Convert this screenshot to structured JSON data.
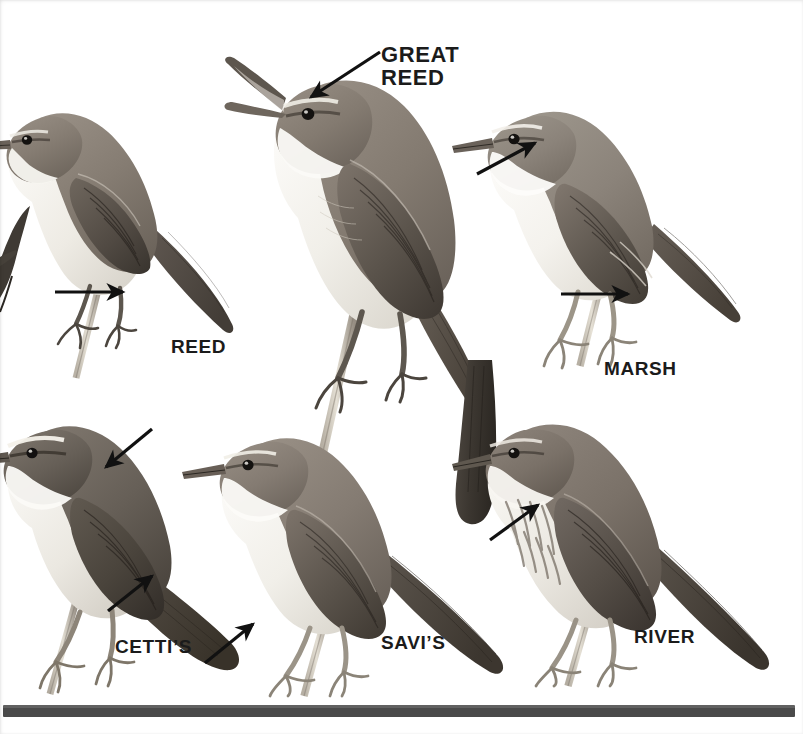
{
  "plate": {
    "title": "Warbler identification plate",
    "medium": "grayscale field-guide illustration",
    "background_color": "#ffffff",
    "width": 803,
    "height": 734
  },
  "labels": [
    {
      "id": "great-reed",
      "text": "GREAT\nREED",
      "x": 381,
      "y": 43,
      "size": "sz-lg",
      "color": "#1b1b1b"
    },
    {
      "id": "reed",
      "text": "REED",
      "x": 171,
      "y": 337,
      "size": "sz-md",
      "color": "#1b1b1b"
    },
    {
      "id": "marsh",
      "text": "MARSH",
      "x": 604,
      "y": 359,
      "size": "sz-md",
      "color": "#1b1b1b"
    },
    {
      "id": "cettis",
      "text": "CETTI’S",
      "x": 115,
      "y": 637,
      "size": "sz-md",
      "color": "#1b1b1b"
    },
    {
      "id": "savis",
      "text": "SAVI’S",
      "x": 381,
      "y": 633,
      "size": "sz-md",
      "color": "#1b1b1b"
    },
    {
      "id": "river",
      "text": "RIVER",
      "x": 634,
      "y": 627,
      "size": "sz-md",
      "color": "#1b1b1b"
    }
  ],
  "birds": [
    {
      "id": "reed-warbler",
      "name": "Reed Warbler",
      "label_ref": "REED",
      "posture": "perched on reed stem, facing left",
      "upper_tone": "#8a8178",
      "under_tone": "#eceae4"
    },
    {
      "id": "great-reed-warbler",
      "name": "Great Reed Warbler",
      "label_ref": "GREAT REED",
      "posture": "perched on reed stem, singing with bill open, facing left",
      "upper_tone": "#857c72",
      "under_tone": "#efede7"
    },
    {
      "id": "marsh-warbler",
      "name": "Marsh Warbler",
      "label_ref": "MARSH",
      "posture": "perched on reed stem, facing left",
      "upper_tone": "#8e867c",
      "under_tone": "#f2f0eb"
    },
    {
      "id": "cettis-warbler",
      "name": "Cetti’s Warbler",
      "label_ref": "CETTI’S",
      "posture": "perched low, rounded tail cocked, facing left",
      "upper_tone": "#6e665d",
      "under_tone": "#e9e6df"
    },
    {
      "id": "savis-warbler",
      "name": "Savi’s Warbler",
      "label_ref": "SAVI’S",
      "posture": "perched on reed stem, long graduated tail, facing left",
      "upper_tone": "#8b8279",
      "under_tone": "#efece6"
    },
    {
      "id": "river-warbler",
      "name": "River Warbler",
      "label_ref": "RIVER",
      "posture": "perched on reed stem, streaked breast, facing left",
      "upper_tone": "#7f776e",
      "under_tone": "#e7e4dc"
    }
  ],
  "pointer_arrows": [
    {
      "id": "great-reed-head-arrow",
      "points_to": "crown / eye-stripe of Great Reed Warbler",
      "x1": 380,
      "y1": 52,
      "x2": 311,
      "y2": 97,
      "color": "#111111",
      "width": 3.2
    },
    {
      "id": "reed-leg-arrow",
      "points_to": "leg colour of Reed Warbler",
      "x1": 55,
      "y1": 292,
      "x2": 123,
      "y2": 292,
      "color": "#111111",
      "width": 3.2
    },
    {
      "id": "marsh-throat-arrow",
      "points_to": "throat / breast of Marsh Warbler",
      "x1": 477,
      "y1": 174,
      "x2": 535,
      "y2": 143,
      "color": "#111111",
      "width": 3.2
    },
    {
      "id": "marsh-leg-arrow",
      "points_to": "pale legs of Marsh Warbler",
      "x1": 561,
      "y1": 294,
      "x2": 628,
      "y2": 294,
      "color": "#111111",
      "width": 3.2
    },
    {
      "id": "cettis-wing-arrow",
      "points_to": "plain dark upperparts of Cetti’s Warbler",
      "x1": 152,
      "y1": 429,
      "x2": 106,
      "y2": 467,
      "color": "#111111",
      "width": 3.2
    },
    {
      "id": "cettis-undertail-arrow",
      "points_to": "undertail coverts of Cetti’s Warbler",
      "x1": 108,
      "y1": 611,
      "x2": 152,
      "y2": 576,
      "color": "#111111",
      "width": 3.2
    },
    {
      "id": "cettis-tail-arrow",
      "points_to": "rounded tail of Cetti’s Warbler",
      "x1": 205,
      "y1": 663,
      "x2": 253,
      "y2": 624,
      "color": "#111111",
      "width": 3.2
    },
    {
      "id": "river-breast-arrow",
      "points_to": "streaked breast of River Warbler",
      "x1": 490,
      "y1": 540,
      "x2": 538,
      "y2": 505,
      "color": "#111111",
      "width": 3.2
    }
  ],
  "bottom_bar": {
    "id": "bottom-rule",
    "color": "#4a4a4a",
    "x": 3,
    "y": 705,
    "width": 792,
    "height": 12
  }
}
